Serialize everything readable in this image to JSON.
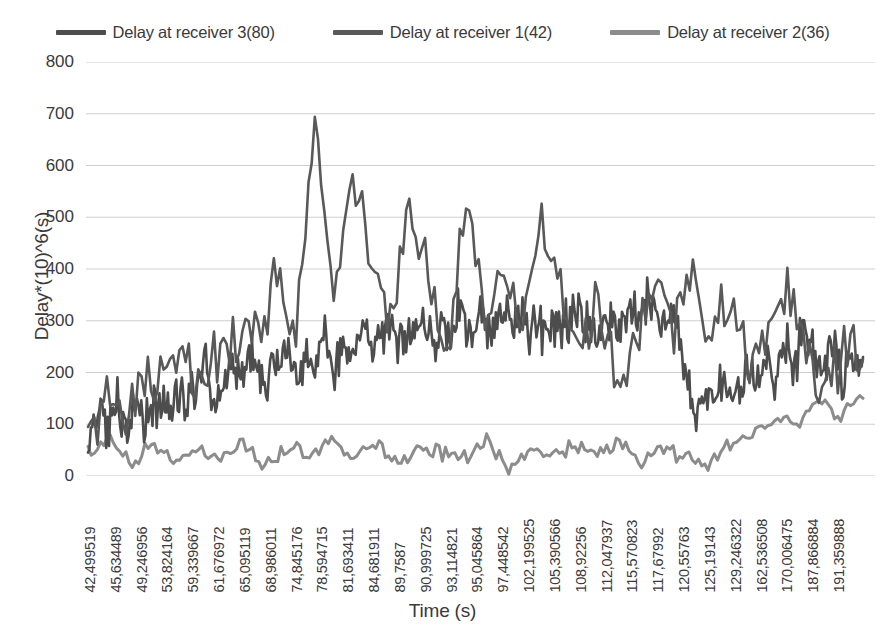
{
  "chart_data": {
    "type": "line",
    "title": "",
    "xlabel": "Time (s)",
    "ylabel": "Delay*(10)^6(s)",
    "ylim": [
      0,
      800
    ],
    "yticks": [
      0,
      100,
      200,
      300,
      400,
      500,
      600,
      700,
      800
    ],
    "grid": true,
    "legend_position": "top",
    "xtick_labels": [
      "42,499519",
      "45,634489",
      "49,246956",
      "53,824164",
      "59,339667",
      "61,676972",
      "65,095119",
      "68,986011",
      "74,845176",
      "78,594715",
      "81,693411",
      "84,681911",
      "89,7587",
      "90,999725",
      "93,114821",
      "95,045864",
      "97,448542",
      "102,199525",
      "105,390566",
      "108,92256",
      "112,047937",
      "115,570823",
      "117,67992",
      "120,55763",
      "125,19143",
      "129,246322",
      "162,536508",
      "170,006475",
      "187,866884",
      "191,359888"
    ],
    "series": [
      {
        "name": "Delay at receiver 3(80)",
        "color": "#4d4d4d",
        "count": 80,
        "values": [
          60,
          120,
          95,
          150,
          110,
          135,
          100,
          145,
          120,
          160,
          130,
          175,
          200,
          150,
          185,
          225,
          190,
          240,
          160,
          210,
          255,
          190,
          230,
          205,
          270,
          215,
          250,
          230,
          290,
          240,
          265,
          300,
          250,
          280,
          310,
          265,
          295,
          250,
          330,
          280,
          310,
          265,
          340,
          290,
          320,
          280,
          300,
          275,
          310,
          290,
          330,
          300,
          270,
          305,
          280,
          320,
          290,
          335,
          300,
          280,
          310,
          200,
          120,
          160,
          140,
          180,
          150,
          210,
          170,
          230,
          190,
          250,
          210,
          300,
          240,
          200,
          260,
          180,
          220,
          230
        ]
      },
      {
        "name": "Delay at receiver 1(42)",
        "color": "#595959",
        "count": 42,
        "values": [
          80,
          140,
          110,
          170,
          200,
          240,
          190,
          260,
          230,
          300,
          380,
          260,
          745,
          330,
          610,
          400,
          290,
          500,
          380,
          250,
          545,
          300,
          420,
          280,
          530,
          350,
          270,
          330,
          180,
          250,
          370,
          290,
          395,
          260,
          350,
          200,
          300,
          360,
          230,
          190,
          240,
          225
        ]
      },
      {
        "name": "Delay at receiver 2(36)",
        "color": "#8c8c8c",
        "count": 36,
        "values": [
          45,
          70,
          30,
          60,
          25,
          55,
          35,
          65,
          20,
          50,
          40,
          70,
          30,
          60,
          25,
          55,
          45,
          35,
          65,
          20,
          50,
          30,
          60,
          40,
          70,
          25,
          55,
          35,
          15,
          60,
          80,
          110,
          95,
          140,
          120,
          150
        ]
      }
    ]
  },
  "legend": {
    "items": [
      {
        "label": "Delay at receiver 3(80)",
        "color": "#4d4d4d"
      },
      {
        "label": "Delay at receiver 1(42)",
        "color": "#595959"
      },
      {
        "label": "Delay at receiver 2(36)",
        "color": "#8c8c8c"
      }
    ]
  }
}
